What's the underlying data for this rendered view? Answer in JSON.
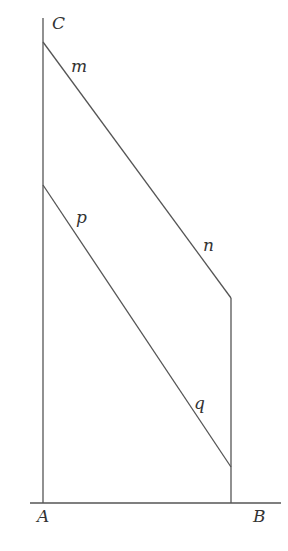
{
  "diagram": {
    "title": "",
    "labels": {
      "C": "C",
      "A": "A",
      "B": "B",
      "m": "m",
      "n": "n",
      "p": "p",
      "q": "q"
    },
    "colors": {
      "line": "#555555",
      "text": "#333333",
      "background": "#ffffff"
    },
    "points": {
      "A": [
        43,
        503
      ],
      "B": [
        231,
        503
      ],
      "C_top": [
        43,
        18
      ],
      "upper_start": [
        43,
        42
      ],
      "upper_end": [
        231,
        298
      ],
      "lower_start": [
        43,
        185
      ],
      "lower_end": [
        231,
        467
      ],
      "baseline_left": [
        30,
        503
      ],
      "baseline_right": [
        281,
        503
      ]
    }
  }
}
